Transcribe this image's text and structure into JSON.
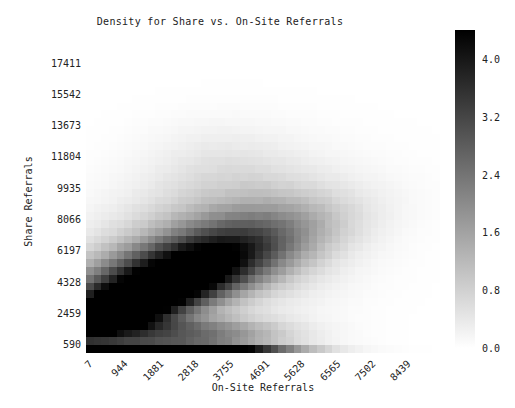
{
  "chart_data": {
    "type": "heatmap",
    "title": "Density for Share vs. On-Site Referrals",
    "xlabel": "On-Site Referrals",
    "ylabel": "Share Referrals",
    "xtick_labels": [
      "7",
      "944",
      "1881",
      "2818",
      "3755",
      "4691",
      "5628",
      "6565",
      "7502",
      "8439"
    ],
    "ytick_labels": [
      "17411",
      "15542",
      "13673",
      "11804",
      "9935",
      "8066",
      "6197",
      "4328",
      "2459",
      "590"
    ],
    "xlim": [
      7,
      8907
    ],
    "ylim": [
      590,
      18346
    ],
    "xtick_values": [
      7,
      944,
      1881,
      2818,
      3755,
      4691,
      5628,
      6565,
      7502,
      8439
    ],
    "ytick_values": [
      17411,
      15542,
      13673,
      11804,
      9935,
      8066,
      6197,
      4328,
      2459,
      590
    ],
    "grid": false,
    "colormap": "greys",
    "colorbar": {
      "label": "",
      "position": "right",
      "vmin": 0.0,
      "vmax": 4.4,
      "tick_values": [
        0.0,
        0.8,
        1.6,
        2.4,
        3.2,
        4.0
      ],
      "tick_labels": [
        "0.0",
        "0.8",
        "1.6",
        "2.4",
        "3.2",
        "4.0"
      ]
    },
    "bins": {
      "nx": 46,
      "ny": 40
    },
    "peaks": [
      {
        "x": 500,
        "y": 700,
        "value": 4.4
      },
      {
        "x": 1600,
        "y": 650,
        "value": 4.1
      },
      {
        "x": 900,
        "y": 2800,
        "value": 2.6
      },
      {
        "x": 2000,
        "y": 4200,
        "value": 2.2
      },
      {
        "x": 2900,
        "y": 6000,
        "value": 1.5
      }
    ]
  },
  "colors": {
    "background": "#ffffff",
    "text": "#222222",
    "cmap_low": "#ffffff",
    "cmap_high": "#000000"
  }
}
